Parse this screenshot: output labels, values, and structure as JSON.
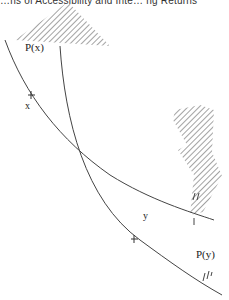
{
  "caption": "…ns of Accessibility and Inte…  ng Returns",
  "labels": {
    "px": "P(x)",
    "x": "x",
    "y": "y",
    "py": "P(y)"
  },
  "colors": {
    "line": "#444444",
    "hatch": "#555555",
    "background": "#ffffff"
  }
}
